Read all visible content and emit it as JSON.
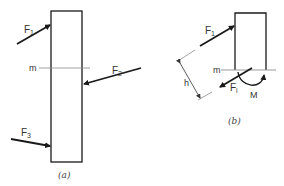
{
  "figure_a": {
    "caption": "(a)",
    "section_label": "m",
    "forces": [
      {
        "label": "F",
        "sub": "1"
      },
      {
        "label": "F",
        "sub": "2"
      },
      {
        "label": "F",
        "sub": "3"
      }
    ]
  },
  "figure_b": {
    "caption": "(b)",
    "section_label": "m",
    "force_top": {
      "label": "F",
      "sub": "1"
    },
    "force_i": {
      "label": "F",
      "sub": "i"
    },
    "moment_label": "M",
    "distance_label": "h"
  },
  "colors": {
    "stroke": "#1a1a1a",
    "thin": "#555555",
    "section_line": "#999999"
  }
}
